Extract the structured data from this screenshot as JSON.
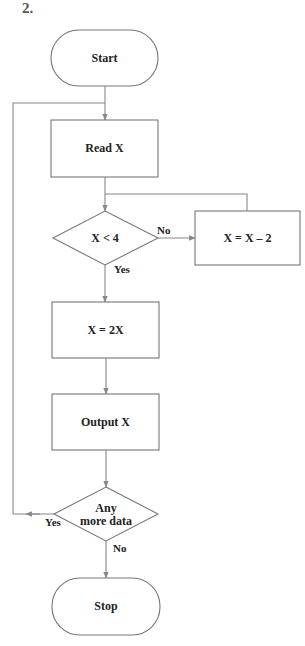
{
  "problem": {
    "number": "2."
  },
  "nodes": {
    "start": {
      "label": "Start",
      "shape": "terminator"
    },
    "read": {
      "label": "Read X",
      "shape": "process"
    },
    "decision1": {
      "label": "X < 4",
      "shape": "decision"
    },
    "subtract": {
      "label": "X = X – 2",
      "shape": "process"
    },
    "double": {
      "label": "X = 2X",
      "shape": "process"
    },
    "output": {
      "label": "Output X",
      "shape": "process"
    },
    "decision2": {
      "label_line1": "Any",
      "label_line2": "more data",
      "shape": "decision"
    },
    "stop": {
      "label": "Stop",
      "shape": "terminator"
    }
  },
  "edges": {
    "decision1_no": "No",
    "decision1_yes": "Yes",
    "decision2_yes": "Yes",
    "decision2_no": "No"
  },
  "colors": {
    "stroke": "#777777",
    "text": "#222222",
    "background": "#ffffff"
  }
}
